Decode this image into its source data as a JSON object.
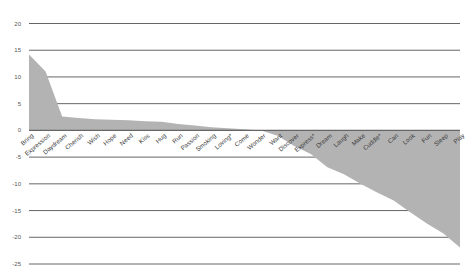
{
  "chart_data": {
    "type": "area",
    "title": "",
    "xlabel": "",
    "ylabel": "",
    "ylim": [
      -25,
      20
    ],
    "yticks": [
      20,
      15,
      10,
      5,
      0,
      -5,
      -10,
      -15,
      -20,
      -25
    ],
    "grid": true,
    "legend": null,
    "categories": [
      "Bring",
      "Expression",
      "Daydream",
      "Cherish",
      "Wish",
      "Hope",
      "Need",
      "Kiss",
      "Hug",
      "Run",
      "Passion",
      "Smoking",
      "Loving*",
      "Come",
      "Wonder",
      "Want",
      "Discover",
      "Express*",
      "Dream",
      "Laugh",
      "Make",
      "Cuddle*",
      "Can",
      "Look",
      "Fun",
      "Sleep",
      "Play"
    ],
    "values": [
      14.2,
      11.0,
      2.6,
      2.3,
      2.1,
      2.0,
      1.9,
      1.7,
      1.6,
      1.2,
      0.9,
      0.6,
      0.4,
      0.2,
      0.0,
      -1.0,
      -2.9,
      -4.4,
      -6.9,
      -8.2,
      -10.0,
      -11.6,
      -13.1,
      -15.3,
      -17.4,
      -19.3,
      -21.9
    ],
    "colors": {
      "fill": "#b3b3b3",
      "grid": "#555555",
      "zero_line": "#666666",
      "text": "#3a3a3a"
    }
  }
}
